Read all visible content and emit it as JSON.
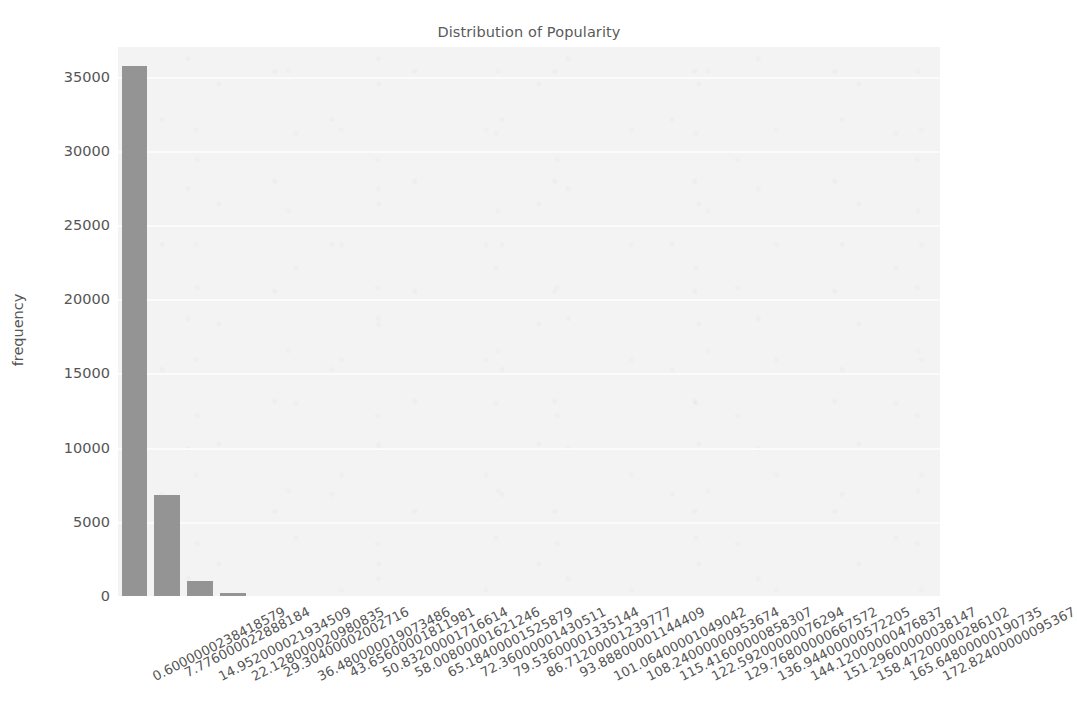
{
  "chart_data": {
    "type": "bar",
    "title": "Distribution of Popularity",
    "xlabel": "",
    "ylabel": "frequency",
    "ylim": [
      0,
      37000
    ],
    "grid": true,
    "legend": null,
    "y_ticks": [
      0,
      5000,
      10000,
      15000,
      20000,
      25000,
      30000,
      35000
    ],
    "y_tick_labels": [
      "0",
      "5000",
      "10000",
      "15000",
      "20000",
      "25000",
      "30000",
      "35000"
    ],
    "categories": [
      "0.6000000238418579",
      "7.776000022888184",
      "14.952000021934509",
      "22.128000020980835",
      "29.30400002002716",
      "36.480000019073486",
      "43.65600001811981",
      "50.83200001716614",
      "58.00800001621246",
      "65.18400001525879",
      "72.36000001430511",
      "79.53600001335144",
      "86.71200001239777",
      "93.88800001144409",
      "101.06400001049042",
      "108.24000000953674",
      "115.41600000858307",
      "122.59200000076294",
      "129.76800000667572",
      "136.94400000572205",
      "144.12000000476837",
      "151.29600000038147",
      "158.47200000286102",
      "165.64800000190735",
      "172.82400000095367"
    ],
    "values": [
      35700,
      6800,
      1020,
      180,
      0,
      0,
      0,
      0,
      0,
      0,
      0,
      0,
      0,
      0,
      0,
      0,
      0,
      0,
      0,
      0,
      0,
      0,
      0,
      0,
      0
    ],
    "bar_color": "#949494",
    "plot_background": "#f3f3f3",
    "gridline_color": "#fbfbfb"
  }
}
